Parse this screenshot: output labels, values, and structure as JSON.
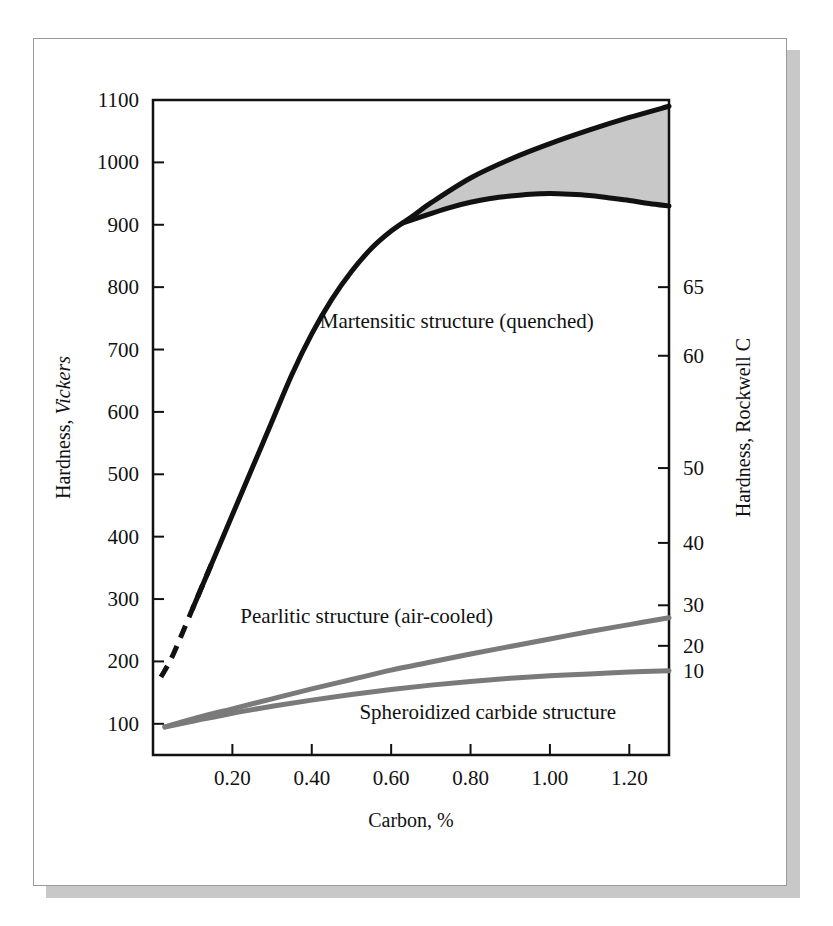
{
  "figure": {
    "background_color": "#ffffff",
    "card_border_color": "#9a9a9a",
    "shadow_color": "#c8c8c8"
  },
  "chart_data": {
    "type": "line",
    "title": "",
    "subtitle": "",
    "xlabel": "Carbon, %",
    "ylabel": "Hardness, Vickers",
    "ylabel_secondary": "Hardness, Rockwell C",
    "xlim": [
      0.0,
      1.3
    ],
    "ylim": [
      50,
      1100
    ],
    "grid": false,
    "legend_position": "inline-annotations",
    "x_ticks": [
      0.2,
      0.4,
      0.6,
      0.8,
      1.0,
      1.2
    ],
    "x_tick_labels": [
      "0.20",
      "0.40",
      "0.60",
      "0.80",
      "1.00",
      "1.20"
    ],
    "y_ticks": [
      100,
      200,
      300,
      400,
      500,
      600,
      700,
      800,
      900,
      1000,
      1100
    ],
    "y_tick_labels": [
      "100",
      "200",
      "300",
      "400",
      "500",
      "600",
      "700",
      "800",
      "900",
      "1000",
      "1100"
    ],
    "y2_ticks": [
      10,
      20,
      30,
      40,
      50,
      60,
      65
    ],
    "y2_tick_labels": [
      "10",
      "20",
      "30",
      "40",
      "50",
      "60",
      "65"
    ],
    "y2_tick_vickers": [
      185,
      225,
      290,
      390,
      510,
      690,
      800
    ],
    "shaded_band": {
      "label": "Martensitic hardness scatter band",
      "fill_color": "#c8c8c8",
      "x_start": 0.63,
      "x_end": 1.3
    },
    "series": [
      {
        "name": "Martensitic structure (quenched)",
        "annotation": "Martensitic structure (quenched)",
        "color": "#111111",
        "line_width": 5,
        "style": "solid-with-dashed-start",
        "dashed_segment_x": [
          0.02,
          0.11
        ],
        "x": [
          0.02,
          0.05,
          0.1,
          0.15,
          0.2,
          0.25,
          0.3,
          0.35,
          0.4,
          0.45,
          0.5,
          0.55,
          0.6,
          0.65,
          0.7,
          0.8,
          0.9,
          1.0,
          1.1,
          1.2,
          1.3
        ],
        "values": [
          175,
          210,
          285,
          360,
          435,
          510,
          585,
          660,
          725,
          780,
          825,
          862,
          890,
          912,
          935,
          975,
          1005,
          1030,
          1052,
          1072,
          1090
        ]
      },
      {
        "name": "Martensitic lower bound",
        "annotation": "",
        "color": "#111111",
        "line_width": 5,
        "style": "solid",
        "x": [
          0.63,
          0.7,
          0.75,
          0.8,
          0.85,
          0.9,
          0.95,
          1.0,
          1.05,
          1.1,
          1.15,
          1.2,
          1.25,
          1.3
        ],
        "values": [
          903,
          918,
          928,
          936,
          942,
          946,
          949,
          950,
          949,
          947,
          943,
          939,
          934,
          930
        ]
      },
      {
        "name": "Pearlitic structure (air-cooled)",
        "annotation": "Pearlitic structure (air-cooled)",
        "color": "#7a7a7a",
        "line_width": 5,
        "style": "solid",
        "x": [
          0.03,
          0.1,
          0.2,
          0.3,
          0.4,
          0.5,
          0.6,
          0.7,
          0.8,
          0.9,
          1.0,
          1.1,
          1.2,
          1.3
        ],
        "values": [
          95,
          108,
          124,
          140,
          156,
          171,
          186,
          199,
          212,
          224,
          236,
          248,
          259,
          270
        ]
      },
      {
        "name": "Spheroidized carbide structure",
        "annotation": "Spheroidized carbide structure",
        "color": "#7a7a7a",
        "line_width": 5,
        "style": "solid",
        "x": [
          0.03,
          0.1,
          0.2,
          0.3,
          0.4,
          0.5,
          0.6,
          0.7,
          0.8,
          0.9,
          1.0,
          1.1,
          1.2,
          1.3
        ],
        "values": [
          95,
          104,
          117,
          128,
          138,
          147,
          155,
          162,
          168,
          173,
          177,
          180,
          183,
          185
        ]
      }
    ],
    "annotations": [
      {
        "text": "Martensitic structure (quenched)",
        "x": 0.42,
        "y": 735
      },
      {
        "text": "Pearlitic structure (air-cooled)",
        "x": 0.22,
        "y": 262
      },
      {
        "text": "Spheroidized carbide structure",
        "x": 0.52,
        "y": 108
      }
    ]
  }
}
